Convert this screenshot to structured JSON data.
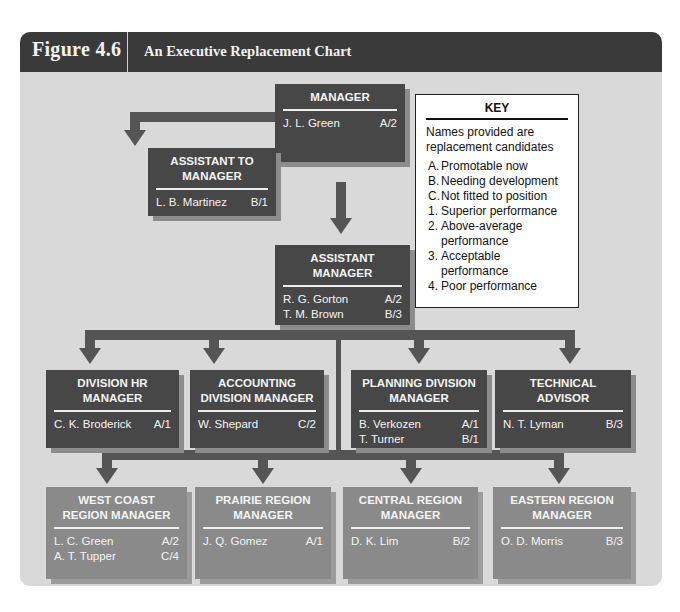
{
  "header": {
    "figure_number": "Figure 4.6",
    "title": "An Executive Replacement Chart"
  },
  "key": {
    "title": "KEY",
    "note": "Names provided are replacement candidates",
    "items": [
      {
        "code": "A.",
        "label": "Promotable now"
      },
      {
        "code": "B.",
        "label": "Needing development"
      },
      {
        "code": "C.",
        "label": "Not fitted to position"
      },
      {
        "code": "1.",
        "label": "Superior performance"
      },
      {
        "code": "2.",
        "label": "Above-average performance"
      },
      {
        "code": "3.",
        "label": "Acceptable performance"
      },
      {
        "code": "4.",
        "label": "Poor performance"
      }
    ]
  },
  "positions": {
    "manager": {
      "title": "MANAGER",
      "candidates": [
        {
          "name": "J. L. Green",
          "rating": "A/2"
        }
      ]
    },
    "assistant_to_manager": {
      "title": "ASSISTANT TO MANAGER",
      "candidates": [
        {
          "name": "L. B. Martinez",
          "rating": "B/1"
        }
      ]
    },
    "assistant_manager": {
      "title": "ASSISTANT MANAGER",
      "candidates": [
        {
          "name": "R. G. Gorton",
          "rating": "A/2"
        },
        {
          "name": "T. M. Brown",
          "rating": "B/3"
        }
      ]
    },
    "division_hr_manager": {
      "title": "DIVISION HR MANAGER",
      "candidates": [
        {
          "name": "C. K. Broderick",
          "rating": "A/1"
        }
      ]
    },
    "accounting_division_manager": {
      "title": "ACCOUNTING DIVISION MANAGER",
      "candidates": [
        {
          "name": "W. Shepard",
          "rating": "C/2"
        }
      ]
    },
    "planning_division_manager": {
      "title": "PLANNING DIVISION MANAGER",
      "candidates": [
        {
          "name": "B. Verkozen",
          "rating": "A/1"
        },
        {
          "name": "T. Turner",
          "rating": "B/1"
        }
      ]
    },
    "technical_advisor": {
      "title": "TECHNICAL ADVISOR",
      "candidates": [
        {
          "name": "N. T. Lyman",
          "rating": "B/3"
        }
      ]
    },
    "west_coast_region_manager": {
      "title": "WEST COAST REGION MANAGER",
      "candidates": [
        {
          "name": "L. C. Green",
          "rating": "A/2"
        },
        {
          "name": "A. T. Tupper",
          "rating": "C/4"
        }
      ]
    },
    "prairie_region_manager": {
      "title": "PRAIRIE REGION MANAGER",
      "candidates": [
        {
          "name": "J. Q. Gomez",
          "rating": "A/1"
        }
      ]
    },
    "central_region_manager": {
      "title": "CENTRAL REGION MANAGER",
      "candidates": [
        {
          "name": "D. K. Lim",
          "rating": "B/2"
        }
      ]
    },
    "eastern_region_manager": {
      "title": "EASTERN REGION MANAGER",
      "candidates": [
        {
          "name": "O. D. Morris",
          "rating": "B/3"
        }
      ]
    }
  },
  "colors": {
    "header_bg": "#3a3a3a",
    "canvas_bg": "#d9d9d9",
    "dark_box": "#474747",
    "light_box": "#8a8a8a",
    "connector": "#555555"
  }
}
